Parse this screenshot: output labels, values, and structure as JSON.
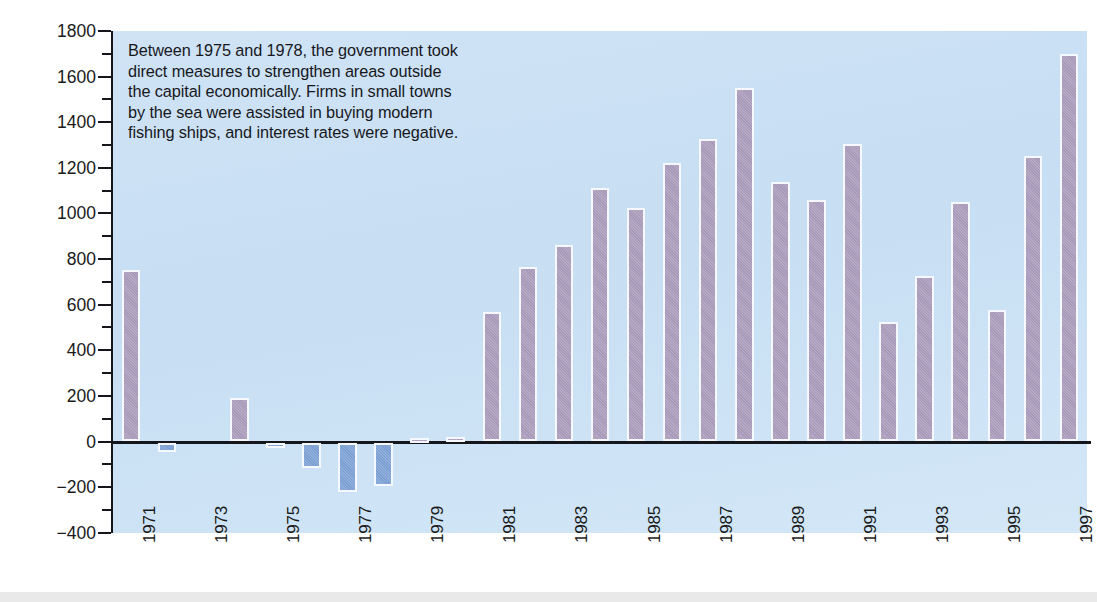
{
  "axis": {
    "y_title": "Migrants",
    "y_ticks": [
      1800,
      1600,
      1400,
      1200,
      1000,
      800,
      600,
      400,
      200,
      0,
      "−200",
      "−400"
    ],
    "x_ticks": [
      "1971",
      "1973",
      "1975",
      "1977",
      "1979",
      "1981",
      "1983",
      "1985",
      "1987",
      "1989",
      "1991",
      "1993",
      "1995",
      "1997"
    ]
  },
  "annotation": {
    "line1": "Between 1975 and 1978, the government took",
    "line2": "direct measures to strengthen areas outside",
    "line3": "the capital economically. Firms in small towns",
    "line4": "by the sea were assisted in buying modern",
    "line5": "fishing ships, and interest rates were negative."
  },
  "colors": {
    "positive_bar": "#a898b9",
    "negative_bar": "#7b9ed3",
    "plot_background": "#cadff4",
    "axis": "#15161c",
    "bar_outline": "#f5f8fc"
  },
  "chart_data": {
    "type": "bar",
    "title": "",
    "xlabel": "",
    "ylabel": "Migrants",
    "ylim": [
      -400,
      1800
    ],
    "ytick_step": 200,
    "yminor_step": 100,
    "grid": false,
    "legend": "none",
    "categories": [
      "1971",
      "1972",
      "1973",
      "1974",
      "1975",
      "1976",
      "1977",
      "1978",
      "1979",
      "1980",
      "1981",
      "1982",
      "1983",
      "1984",
      "1985",
      "1986",
      "1987",
      "1988",
      "1989",
      "1990",
      "1991",
      "1992",
      "1993",
      "1994",
      "1995",
      "1996",
      "1997"
    ],
    "values": [
      750,
      -40,
      0,
      190,
      -20,
      -110,
      -215,
      -190,
      15,
      20,
      570,
      765,
      860,
      1110,
      1025,
      1220,
      1325,
      1550,
      1140,
      1060,
      1305,
      525,
      725,
      1050,
      575,
      1250,
      1700
    ],
    "annotations": [
      "Between 1975 and 1978, the government took direct measures to strengthen areas outside the capital economically. Firms in small towns by the sea were assisted in buying modern fishing ships, and interest rates were negative."
    ]
  }
}
